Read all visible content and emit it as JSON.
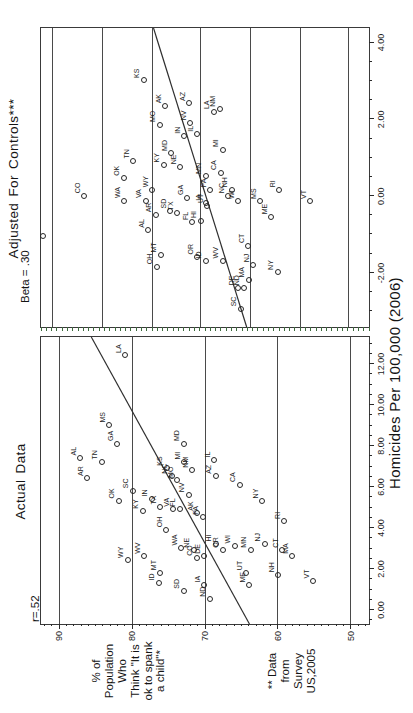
{
  "figure": {
    "x_axis_label": "Homicides Per 100,000 (2006)",
    "y_axis_label_lines": [
      "% of",
      "Population",
      "Who",
      "Think \"It is",
      "ok to spank",
      "a child\"*"
    ],
    "footnote_lines": [
      "** Data",
      "from",
      "Survey",
      "US,2005"
    ],
    "colors": {
      "frame": "#3a3a3a",
      "ink": "#1c1c1c",
      "regression_line": "#2f2f2f",
      "adjusted_axis_tick_green": "#3d6b3d"
    }
  },
  "chart_data": [
    {
      "type": "scatter",
      "title": "Actual Data",
      "stat_label": "r=.52",
      "xlabel": "Homicides Per 100,000 (2006)",
      "ylabel": "% of Population Who Think \"It is ok to spank a child\"*",
      "xlim": [
        -0.68,
        13.32
      ],
      "ylim": [
        47.5,
        92.5
      ],
      "x_tick_values": [
        0,
        2,
        4,
        6,
        8,
        10,
        12
      ],
      "x_tick_labels": [
        "0.00",
        "2.00",
        "4.00",
        "6.00",
        "8.00",
        "10.00",
        "12.00"
      ],
      "y_tick_values": [
        90,
        80,
        70,
        60,
        50
      ],
      "y_tick_labels": [
        "90",
        "80",
        "70",
        "60",
        "50"
      ],
      "grid": "horizontal lines at y ticks",
      "regression_line": {
        "x": [
          -0.68,
          13.32
        ],
        "y": [
          63.9,
          85.6
        ]
      },
      "points": [
        [
          "LA",
          12.4,
          81.0
        ],
        [
          "MS",
          9.0,
          83.2
        ],
        [
          "GA",
          8.1,
          82.1
        ],
        [
          "AL",
          7.4,
          87.2
        ],
        [
          "AR",
          6.4,
          86.2
        ],
        [
          "TN",
          7.2,
          84.2
        ],
        [
          "MD",
          8.1,
          73.0
        ],
        [
          "OK",
          5.3,
          81.9
        ],
        [
          "SC",
          5.8,
          80.0
        ],
        [
          "KY",
          4.8,
          78.6
        ],
        [
          "IN",
          5.4,
          77.4
        ],
        [
          "TX",
          5.0,
          76.2
        ],
        [
          "VA",
          4.9,
          74.4
        ],
        [
          "FL",
          4.9,
          73.5
        ],
        [
          "NV",
          5.6,
          72.3
        ],
        [
          "KS",
          6.9,
          75.3
        ],
        [
          "NC",
          6.5,
          74.6
        ],
        [
          "MO",
          6.3,
          73.9
        ],
        [
          "MI",
          7.2,
          72.9
        ],
        [
          "NM",
          6.8,
          71.8
        ],
        [
          "IL",
          7.3,
          68.8
        ],
        [
          "AZ",
          6.5,
          68.6
        ],
        [
          "CA",
          6.1,
          65.3
        ],
        [
          "NY",
          5.3,
          62.2
        ],
        [
          "RI",
          4.3,
          59.2
        ],
        [
          "OH",
          3.9,
          75.4
        ],
        [
          "WY",
          2.4,
          80.7
        ],
        [
          "WV",
          2.6,
          78.4
        ],
        [
          "MT",
          1.8,
          76.2
        ],
        [
          "ID",
          1.3,
          76.4
        ],
        [
          "SD",
          0.9,
          73.0
        ],
        [
          "WA",
          3.0,
          73.3
        ],
        [
          "NE",
          2.9,
          71.6
        ],
        [
          "CO",
          2.5,
          71.2
        ],
        [
          "DE",
          2.6,
          70.2
        ],
        [
          "OR",
          2.9,
          67.6
        ],
        [
          "IA",
          1.2,
          70.2
        ],
        [
          "ND",
          0.5,
          69.4
        ],
        [
          "HI",
          3.2,
          68.6
        ],
        [
          "WI",
          3.1,
          66.0
        ],
        [
          "MN",
          2.9,
          63.8
        ],
        [
          "NJ",
          3.2,
          61.9
        ],
        [
          "UT",
          1.8,
          64.4
        ],
        [
          "ME",
          1.2,
          64.0
        ],
        [
          "NH",
          1.7,
          60.0
        ],
        [
          "CT",
          2.9,
          59.5
        ],
        [
          "MA",
          2.6,
          58.1
        ],
        [
          "VT",
          1.4,
          55.2
        ],
        [
          "AK",
          4.7,
          71.1
        ],
        [
          "PA",
          4.5,
          70.4
        ]
      ]
    },
    {
      "type": "scatter",
      "title": "Adjusted For Controls***",
      "stat_label": "Beta = .30",
      "xlabel": "Homicides Per 100,000 (2006)",
      "ylabel": "(unlabeled adjusted approval scale; y given as fraction of panel height from top)",
      "xlim": [
        -3.41,
        4.38
      ],
      "x_tick_values": [
        -2,
        0,
        2,
        4
      ],
      "x_tick_labels": [
        "-2.00",
        "0.00",
        "2.00",
        "4.00"
      ],
      "grid_y_fractions": [
        0.034,
        0.188,
        0.34,
        0.485,
        0.639,
        0.79,
        0.938
      ],
      "regression_line": {
        "x": [
          4.38,
          -3.41
        ],
        "y_frac": [
          0.343,
          0.627
        ]
      },
      "points": [
        [
          "CO",
          0.0,
          0.13
        ],
        [
          "WA",
          -0.13,
          0.252
        ],
        [
          "OK",
          0.45,
          0.25
        ],
        [
          "TN",
          0.9,
          0.28
        ],
        [
          "KS",
          3.0,
          0.312
        ],
        [
          "VA",
          -0.13,
          0.318
        ],
        [
          "WY",
          0.15,
          0.338
        ],
        [
          "AL",
          -0.9,
          0.326
        ],
        [
          "AR",
          -0.5,
          0.348
        ],
        [
          "OH",
          -1.85,
          0.352
        ],
        [
          "MO",
          1.85,
          0.361
        ],
        [
          "MT",
          -1.55,
          0.364
        ],
        [
          "AK",
          2.34,
          0.377
        ],
        [
          "KY",
          0.8,
          0.373
        ],
        [
          "SD",
          -0.4,
          0.392
        ],
        [
          "MD",
          1.1,
          0.395
        ],
        [
          "TX",
          -0.45,
          0.414
        ],
        [
          "NE",
          0.75,
          0.423
        ],
        [
          "IN",
          1.55,
          0.435
        ],
        [
          "GA",
          -0.05,
          0.444
        ],
        [
          "AZ",
          2.4,
          0.45
        ],
        [
          "NV",
          1.9,
          0.454
        ],
        [
          "FL",
          -0.7,
          0.46
        ],
        [
          "IL",
          1.6,
          0.475
        ],
        [
          "OR",
          -1.6,
          0.475
        ],
        [
          "HI",
          -0.65,
          0.485
        ],
        [
          "IA",
          -0.2,
          0.5
        ],
        [
          "MN",
          0.5,
          0.5
        ],
        [
          "ID",
          -1.7,
          0.5
        ],
        [
          "UT",
          -0.26,
          0.506
        ],
        [
          "PA",
          0.15,
          0.515
        ],
        [
          "LA",
          2.19,
          0.525
        ],
        [
          "NM",
          2.25,
          0.543
        ],
        [
          "CA",
          0.6,
          0.546
        ],
        [
          "MI",
          1.2,
          0.552
        ],
        [
          "WV",
          -1.7,
          0.552
        ],
        [
          "NC",
          0.0,
          0.57
        ],
        [
          "NH",
          0.15,
          0.58
        ],
        [
          "SC",
          -2.95,
          0.607
        ],
        [
          "DE",
          -2.4,
          0.6
        ],
        [
          "ND",
          -2.4,
          0.617
        ],
        [
          "WI",
          -0.15,
          0.6
        ],
        [
          "NJ",
          -1.8,
          0.645
        ],
        [
          "CT",
          -1.3,
          0.63
        ],
        [
          "MA",
          -2.2,
          0.632
        ],
        [
          "MS",
          -0.15,
          0.667
        ],
        [
          "ME",
          -0.55,
          0.7
        ],
        [
          "RI",
          0.15,
          0.725
        ],
        [
          "NY",
          -2.0,
          0.72
        ],
        [
          "VT",
          -0.15,
          0.82
        ],
        [
          "",
          -1.05,
          0.004
        ]
      ]
    }
  ]
}
